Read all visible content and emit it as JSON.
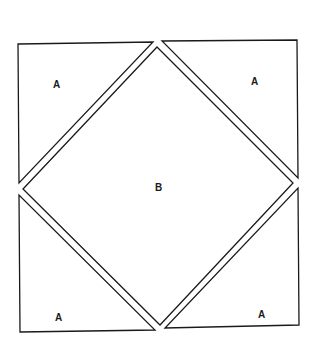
{
  "diagram": {
    "pieces": {
      "top_left": {
        "label": "A"
      },
      "top_right": {
        "label": "A"
      },
      "center": {
        "label": "B"
      },
      "bottom_left": {
        "label": "A"
      },
      "bottom_right": {
        "label": "A"
      }
    },
    "colors": {
      "stroke": "#1a1a1a",
      "fill": "#ffffff"
    }
  }
}
